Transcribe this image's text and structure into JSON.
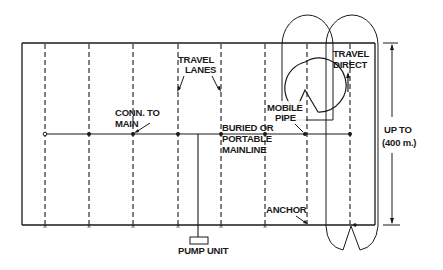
{
  "diagram": {
    "labels": {
      "travel_lanes_1": "TRAVEL",
      "travel_lanes_2": "LANES",
      "conn_main_1": "CONN. TO",
      "conn_main_2": "MAIN",
      "buried_1": "BURIED OR",
      "buried_2": "PORTABLE",
      "buried_3": "MAINLINE",
      "mobile_1": "MOBILE",
      "mobile_2": "PIPE",
      "travel_direct_1": "TRAVEL",
      "travel_direct_2": "DIRECT",
      "up_to_1": "UP TO",
      "up_to_2": "(400 m.)",
      "anchor": "ANCHOR",
      "pump": "PUMP UNIT"
    },
    "colors": {
      "ink": "#1a1a1a",
      "shade": "#a8a8a8",
      "background": "#ffffff"
    },
    "lanes_x": [
      45,
      89,
      133,
      178,
      221,
      265,
      307,
      350
    ],
    "mainline_y": 134
  }
}
